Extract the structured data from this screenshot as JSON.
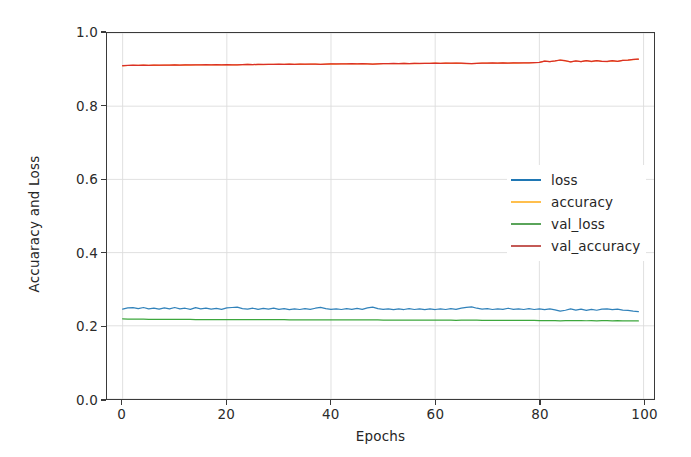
{
  "chart_data": {
    "type": "line",
    "title": "",
    "xlabel": "Epochs",
    "ylabel": "Accuaracy and Loss",
    "xlim": [
      -3,
      102
    ],
    "ylim": [
      0.0,
      1.0
    ],
    "xticks": [
      "0",
      "20",
      "40",
      "60",
      "80",
      "100"
    ],
    "xtick_values": [
      0,
      20,
      40,
      60,
      80,
      100
    ],
    "yticks": [
      "0.0",
      "0.2",
      "0.4",
      "0.6",
      "0.8",
      "1.0"
    ],
    "ytick_values": [
      0.0,
      0.2,
      0.4,
      0.6,
      0.8,
      1.0
    ],
    "grid": true,
    "legend_position": "center right",
    "x": [
      0,
      1,
      2,
      3,
      4,
      5,
      6,
      7,
      8,
      9,
      10,
      11,
      12,
      13,
      14,
      15,
      16,
      17,
      18,
      19,
      20,
      21,
      22,
      23,
      24,
      25,
      26,
      27,
      28,
      29,
      30,
      31,
      32,
      33,
      34,
      35,
      36,
      37,
      38,
      39,
      40,
      41,
      42,
      43,
      44,
      45,
      46,
      47,
      48,
      49,
      50,
      51,
      52,
      53,
      54,
      55,
      56,
      57,
      58,
      59,
      60,
      61,
      62,
      63,
      64,
      65,
      66,
      67,
      68,
      69,
      70,
      71,
      72,
      73,
      74,
      75,
      76,
      77,
      78,
      79,
      80,
      81,
      82,
      83,
      84,
      85,
      86,
      87,
      88,
      89,
      90,
      91,
      92,
      93,
      94,
      95,
      96,
      97,
      98,
      99
    ],
    "series": [
      {
        "name": "loss",
        "color": "#1f77b4",
        "values": [
          0.2455,
          0.249,
          0.2495,
          0.247,
          0.25,
          0.2465,
          0.2485,
          0.2455,
          0.249,
          0.246,
          0.25,
          0.2465,
          0.248,
          0.245,
          0.2495,
          0.246,
          0.2485,
          0.2455,
          0.2475,
          0.245,
          0.249,
          0.25,
          0.251,
          0.247,
          0.2455,
          0.248,
          0.245,
          0.2475,
          0.2455,
          0.2485,
          0.245,
          0.247,
          0.244,
          0.2465,
          0.2445,
          0.247,
          0.245,
          0.248,
          0.2505,
          0.247,
          0.245,
          0.2465,
          0.2445,
          0.247,
          0.245,
          0.2475,
          0.245,
          0.249,
          0.251,
          0.247,
          0.245,
          0.2465,
          0.244,
          0.246,
          0.2445,
          0.247,
          0.2445,
          0.2465,
          0.244,
          0.246,
          0.2445,
          0.2465,
          0.2445,
          0.247,
          0.245,
          0.2485,
          0.2505,
          0.2515,
          0.248,
          0.2455,
          0.247,
          0.2445,
          0.2465,
          0.245,
          0.248,
          0.245,
          0.2465,
          0.2445,
          0.247,
          0.2445,
          0.2465,
          0.244,
          0.246,
          0.2435,
          0.24,
          0.2425,
          0.2465,
          0.243,
          0.2455,
          0.242,
          0.245,
          0.2425,
          0.2455,
          0.2465,
          0.244,
          0.2455,
          0.243,
          0.242,
          0.24,
          0.2385
        ]
      },
      {
        "name": "accuracy",
        "color": "#ff7f0e",
        "values": [
          0.9105,
          0.9112,
          0.9118,
          0.9114,
          0.912,
          0.9116,
          0.9122,
          0.9118,
          0.9124,
          0.912,
          0.9126,
          0.9122,
          0.9128,
          0.9124,
          0.913,
          0.9126,
          0.9132,
          0.9128,
          0.9134,
          0.913,
          0.9136,
          0.9128,
          0.9126,
          0.9134,
          0.914,
          0.9136,
          0.9142,
          0.9138,
          0.9144,
          0.914,
          0.9146,
          0.9142,
          0.9148,
          0.9144,
          0.915,
          0.9146,
          0.9152,
          0.9148,
          0.9142,
          0.915,
          0.9156,
          0.9152,
          0.9158,
          0.9154,
          0.916,
          0.9156,
          0.9162,
          0.9156,
          0.915,
          0.9158,
          0.9164,
          0.916,
          0.9166,
          0.9162,
          0.9168,
          0.9164,
          0.917,
          0.9166,
          0.9172,
          0.9168,
          0.9174,
          0.917,
          0.9176,
          0.9172,
          0.9178,
          0.9172,
          0.9166,
          0.9162,
          0.917,
          0.9178,
          0.9174,
          0.918,
          0.9176,
          0.9182,
          0.9176,
          0.9184,
          0.918,
          0.9186,
          0.9182,
          0.9188,
          0.9195,
          0.923,
          0.9215,
          0.9235,
          0.926,
          0.924,
          0.921,
          0.9235,
          0.9215,
          0.9245,
          0.922,
          0.9245,
          0.9225,
          0.922,
          0.924,
          0.9225,
          0.925,
          0.926,
          0.9275,
          0.9285
        ]
      },
      {
        "name": "val_loss",
        "color": "#2ca02c",
        "values": [
          0.219,
          0.2185,
          0.2182,
          0.218,
          0.218,
          0.2178,
          0.2178,
          0.2176,
          0.2176,
          0.2175,
          0.2174,
          0.2174,
          0.2173,
          0.2173,
          0.2172,
          0.2172,
          0.2171,
          0.2171,
          0.217,
          0.217,
          0.217,
          0.2171,
          0.2172,
          0.217,
          0.2169,
          0.2169,
          0.2168,
          0.2168,
          0.2167,
          0.2167,
          0.2166,
          0.2166,
          0.2165,
          0.2165,
          0.2164,
          0.2164,
          0.2163,
          0.2163,
          0.2164,
          0.2163,
          0.2162,
          0.2162,
          0.2161,
          0.2161,
          0.216,
          0.216,
          0.2159,
          0.216,
          0.2161,
          0.2159,
          0.2158,
          0.2158,
          0.2157,
          0.2157,
          0.2156,
          0.2156,
          0.2155,
          0.2155,
          0.2154,
          0.2154,
          0.2153,
          0.2153,
          0.2152,
          0.2152,
          0.2151,
          0.2152,
          0.2153,
          0.2153,
          0.2152,
          0.215,
          0.215,
          0.2149,
          0.2149,
          0.2148,
          0.2149,
          0.2147,
          0.2147,
          0.2146,
          0.2146,
          0.2145,
          0.2144,
          0.214,
          0.2142,
          0.2139,
          0.2137,
          0.2139,
          0.2142,
          0.2139,
          0.2141,
          0.2138,
          0.214,
          0.2137,
          0.2139,
          0.214,
          0.2137,
          0.2139,
          0.2136,
          0.2135,
          0.2133,
          0.2132
        ]
      },
      {
        "name": "val_accuracy",
        "color": "#d62728",
        "values": [
          0.9108,
          0.9114,
          0.9119,
          0.9116,
          0.9121,
          0.9118,
          0.9123,
          0.912,
          0.9125,
          0.9122,
          0.9127,
          0.9124,
          0.9129,
          0.9126,
          0.9131,
          0.9128,
          0.9133,
          0.913,
          0.9135,
          0.9132,
          0.9137,
          0.913,
          0.9128,
          0.9135,
          0.9141,
          0.9138,
          0.9143,
          0.914,
          0.9145,
          0.9142,
          0.9147,
          0.9144,
          0.9149,
          0.9146,
          0.9151,
          0.9148,
          0.9153,
          0.915,
          0.9144,
          0.9152,
          0.9157,
          0.9154,
          0.9159,
          0.9156,
          0.9161,
          0.9158,
          0.9163,
          0.9158,
          0.9152,
          0.9159,
          0.9165,
          0.9162,
          0.9167,
          0.9164,
          0.9169,
          0.9166,
          0.9171,
          0.9168,
          0.9173,
          0.917,
          0.9175,
          0.9172,
          0.9177,
          0.9174,
          0.9179,
          0.9174,
          0.9168,
          0.9164,
          0.9172,
          0.9179,
          0.9176,
          0.9181,
          0.9178,
          0.9183,
          0.9178,
          0.9185,
          0.9182,
          0.9187,
          0.9184,
          0.9189,
          0.9197,
          0.9232,
          0.9217,
          0.9237,
          0.9262,
          0.9242,
          0.9212,
          0.9237,
          0.9217,
          0.9247,
          0.9222,
          0.9247,
          0.9227,
          0.9222,
          0.9242,
          0.9227,
          0.9252,
          0.9262,
          0.9277,
          0.9287
        ]
      }
    ]
  },
  "legend": {
    "items": [
      {
        "label": "loss",
        "color": "#1f77b4"
      },
      {
        "label": "accuracy",
        "color": "#ffbf4d"
      },
      {
        "label": "val_loss",
        "color": "#5aa45a"
      },
      {
        "label": "val_accuracy",
        "color": "#c45a56"
      }
    ]
  },
  "axes": {
    "x_label": "Epochs",
    "y_label": "Accuaracy and Loss",
    "x_ticks": [
      "0",
      "20",
      "40",
      "60",
      "80",
      "100"
    ],
    "y_ticks": [
      "0.0",
      "0.2",
      "0.4",
      "0.6",
      "0.8",
      "1.0"
    ]
  },
  "colors": {
    "grid": "#dcdcdc",
    "axis": "#3a3a3a",
    "background": "#ffffff",
    "text": "#262626"
  }
}
